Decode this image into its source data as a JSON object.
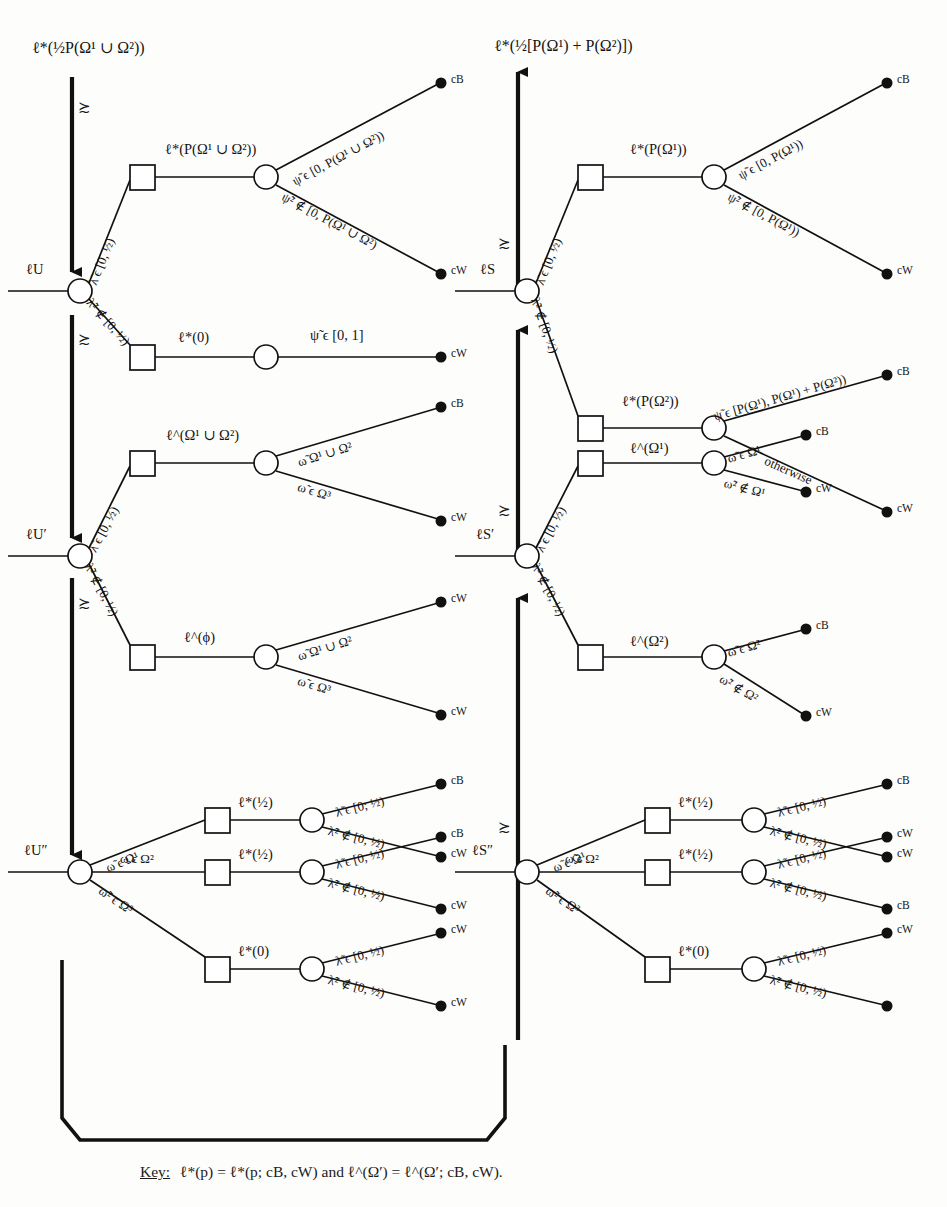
{
  "figure": {
    "type": "decision-tree-diagram",
    "key_text_prefix": "Key:",
    "key_text": "ℓ*(p) = ℓ*(p; cB, cW) and ℓ^(Ω′) = ℓ^(Ω′; cB, cW).",
    "outcome_black": "cB",
    "outcome_white": "cW",
    "pref_symbol": "≿"
  },
  "left_column": {
    "top_value": "ℓ*(½P(Ω¹ ∪ Ω²))",
    "roots": [
      {
        "name": "lU",
        "label": "ℓU"
      },
      {
        "name": "lU1",
        "label": "ℓU′"
      },
      {
        "name": "lU2",
        "label": "ℓU″"
      }
    ],
    "tree_lU": {
      "branch_up_label": "λ̃ ϵ [0, ½)",
      "branch_down_label": "λ̃² ∉ [0, ½)",
      "up_chance_value": "ℓ*(P(Ω¹ ∪ Ω²))",
      "up_out_high": "ψ̃ ϵ [0, P(Ω¹ ∪ Ω²))",
      "up_out_low": "ψ̃² ∉ [0, P(Ω¹ ∪ Ω²)",
      "up_term_high": "cB",
      "up_term_low": "cW",
      "down_chance_value": "ℓ*(0)",
      "down_out": "ψ̃ ϵ [0, 1]",
      "down_term": "cW"
    },
    "tree_lU1": {
      "branch_up_label": "λ̃ ϵ [0, ½)",
      "branch_down_label": "λ̃² ∉ [0, ½)",
      "up_chance_value": "ℓ^(Ω¹ ∪ Ω²)",
      "up_out_high": "ω̃ Ω¹ ∪ Ω²",
      "up_out_low": "ω̃ ϵ Ω³",
      "up_term_high": "cB",
      "up_term_low": "cW",
      "down_chance_value": "ℓ^(ϕ)",
      "down_out_high": "ω̃ Ω¹ ∪ Ω²",
      "down_out_low": "ω̃ ϵ Ω³",
      "down_term_high": "cW",
      "down_term_low": "cW"
    },
    "tree_lU2": {
      "branches": [
        "ω̃ ϵ Ω¹",
        "ω̃ ϵ Ω²",
        "ω̃² ϵ Ω³"
      ],
      "values": [
        "ℓ*(½)",
        "ℓ*(½)",
        "ℓ*(0)"
      ],
      "out_high": [
        "λ̃ ϵ [0; ½)",
        "λ̃ ϵ [0, ½)",
        "λ̃ ϵ [0, ½)"
      ],
      "out_low": [
        "λ̃² ∉ [0, ½)",
        "λ̃² ∉ [0, ½)",
        "λ̃² ∉ [0, ½)"
      ],
      "term_high": [
        "cB",
        "cB",
        "cW"
      ],
      "term_low": [
        "cW",
        "cW",
        "cW"
      ]
    }
  },
  "right_column": {
    "top_value": "ℓ*(½[P(Ω¹) + P(Ω²)])",
    "roots": [
      {
        "name": "lS",
        "label": "ℓS"
      },
      {
        "name": "lS1",
        "label": "ℓS′"
      },
      {
        "name": "lS2",
        "label": "ℓS″"
      }
    ],
    "tree_lS": {
      "branch_up_label": "λ̃ ϵ [0, ½)",
      "branch_down_label": "λ̃² ∉ [0, ½)",
      "up_chance_value": "ℓ*(P(Ω¹))",
      "up_out_high": "ψ̃ ϵ [0, P(Ω¹))",
      "up_out_low": "ψ̃² ∉ [0, P(Ω¹))",
      "up_term_high": "cB",
      "up_term_low": "cW",
      "down_chance_value": "ℓ*(P(Ω²))",
      "down_out_high": "ψ̃ ϵ [P(Ω¹), P(Ω¹) + P(Ω²))",
      "down_out_low": "otherwise",
      "down_term_high": "cB",
      "down_term_low": "cW"
    },
    "tree_lS1": {
      "branch_up_label": "λ̃ ϵ [0, ½)",
      "branch_down_label": "λ̃² ∉ [0, ½)",
      "up_chance_value": "ℓ^(Ω¹)",
      "up_out_high": "ω̃ ϵ Ω¹",
      "up_out_low": "ω̃² ∉ Ω¹",
      "up_term_high": "cB",
      "up_term_low": "cW",
      "down_chance_value": "ℓ^(Ω²)",
      "down_out_high": "ω̃ ϵ Ω²",
      "down_out_low": "ω̃² ∉ Ω²",
      "down_term_high": "cB",
      "down_term_low": "cW"
    },
    "tree_lS2": {
      "branches": [
        "ω̃ ϵ Ω¹",
        "ω̃ ϵ Ω²",
        "ω̃² ϵ Ω³"
      ],
      "values": [
        "ℓ*(½)",
        "ℓ*(½)",
        "ℓ*(0)"
      ],
      "out_high": [
        "λ̃ ϵ [0, ½)",
        "λ̃ ϵ [0, ½)",
        "λ̃ ϵ [0, ½)"
      ],
      "out_low": [
        "λ̃² ∉ [0, ½)",
        "λ̃² ∉ [0, ½)",
        "λ̃² ∉ [0, ½)"
      ],
      "term_high": [
        "cB",
        "cW",
        "cW"
      ],
      "term_low": [
        "cW",
        "cB",
        "cW"
      ]
    }
  }
}
